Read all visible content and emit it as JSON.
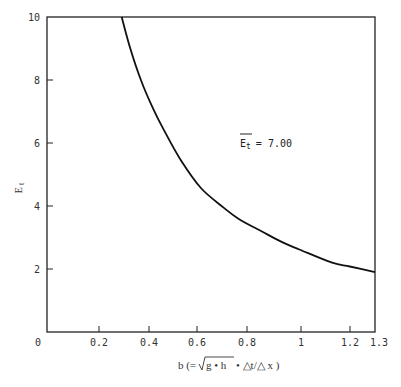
{
  "chart_data": {
    "type": "line",
    "title": "",
    "xlabel": "b (= √(g·h)·△t/△x)",
    "ylabel": "E t",
    "xlim": [
      0,
      1.3
    ],
    "ylim": [
      0,
      10
    ],
    "x_ticks": [
      "0",
      "0.2",
      "0.4",
      "0.6",
      "0.8",
      "1",
      "1.2",
      "1.3"
    ],
    "y_ticks": [
      "2",
      "4",
      "6",
      "8",
      "10"
    ],
    "grid": false,
    "legend": null,
    "annotations": [
      {
        "text": "E t = 7.00",
        "overline": "E t",
        "x": 0.78,
        "y": 6.0
      }
    ],
    "series": [
      {
        "name": "E_t",
        "x": [
          0.296,
          0.33,
          0.372,
          0.42,
          0.464,
          0.53,
          0.61,
          0.7,
          0.76,
          0.85,
          0.93,
          1.0,
          1.13,
          1.2,
          1.3
        ],
        "y": [
          10.0,
          9.0,
          8.0,
          7.1,
          6.4,
          5.46,
          4.57,
          3.95,
          3.59,
          3.2,
          2.86,
          2.62,
          2.2,
          2.08,
          1.9
        ]
      }
    ]
  },
  "axes": {
    "x_tick_labels": [
      "0",
      "0.2",
      "0.4",
      "0.6",
      "0.8",
      "1",
      "1.2",
      "1.3"
    ],
    "y_tick_labels": [
      "2",
      "4",
      "6",
      "8",
      "10"
    ],
    "x_label_prefix": "b (=",
    "x_label_sqrt": "g • h",
    "x_label_suffix": "• △t/△ x )",
    "y_label_main": "E",
    "y_label_sub": "t"
  },
  "annotation": {
    "main": "E",
    "sub": "t",
    "value": "= 7.00"
  }
}
